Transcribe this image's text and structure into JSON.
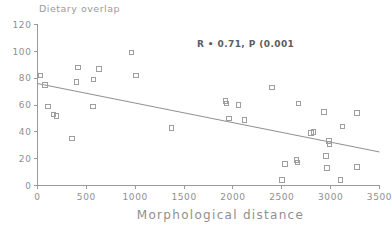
{
  "chart_data": {
    "type": "scatter",
    "title": "",
    "xlabel": "Morphological distance",
    "ylabel": "Dietary overlap",
    "xlim": [
      0,
      3500
    ],
    "ylim": [
      0,
      120
    ],
    "xticks": [
      0,
      500,
      1000,
      1500,
      2000,
      2500,
      3000,
      3500
    ],
    "yticks": [
      0,
      20,
      40,
      60,
      80,
      100,
      120
    ],
    "xtick_labels": [
      "0",
      "500",
      "1000",
      "1500",
      "2000",
      "2500",
      "3000",
      "3500"
    ],
    "ytick_labels": [
      "0",
      "20",
      "40",
      "60",
      "80",
      "100",
      "120"
    ],
    "grid": false,
    "legend": null,
    "annotation": "R • 0.71, P (0.001",
    "annotation_meaning": "R = 0.71, P < 0.001",
    "marker": "open-square",
    "marker_color": "#9e9e9e",
    "points": [
      {
        "x": 30,
        "y": 82
      },
      {
        "x": 75,
        "y": 75
      },
      {
        "x": 110,
        "y": 59
      },
      {
        "x": 165,
        "y": 53
      },
      {
        "x": 195,
        "y": 52
      },
      {
        "x": 350,
        "y": 35
      },
      {
        "x": 400,
        "y": 77
      },
      {
        "x": 415,
        "y": 88
      },
      {
        "x": 565,
        "y": 59
      },
      {
        "x": 575,
        "y": 79
      },
      {
        "x": 630,
        "y": 87
      },
      {
        "x": 960,
        "y": 99
      },
      {
        "x": 1010,
        "y": 82
      },
      {
        "x": 1370,
        "y": 43
      },
      {
        "x": 1925,
        "y": 63
      },
      {
        "x": 1935,
        "y": 61
      },
      {
        "x": 1960,
        "y": 50
      },
      {
        "x": 2055,
        "y": 60
      },
      {
        "x": 2120,
        "y": 49
      },
      {
        "x": 2400,
        "y": 73
      },
      {
        "x": 2500,
        "y": 4
      },
      {
        "x": 2530,
        "y": 16
      },
      {
        "x": 2650,
        "y": 19
      },
      {
        "x": 2660,
        "y": 17
      },
      {
        "x": 2670,
        "y": 61
      },
      {
        "x": 2800,
        "y": 39
      },
      {
        "x": 2825,
        "y": 40
      },
      {
        "x": 2930,
        "y": 55
      },
      {
        "x": 2950,
        "y": 22
      },
      {
        "x": 2960,
        "y": 13
      },
      {
        "x": 2985,
        "y": 33
      },
      {
        "x": 2990,
        "y": 31
      },
      {
        "x": 3100,
        "y": 4
      },
      {
        "x": 3120,
        "y": 44
      },
      {
        "x": 3270,
        "y": 14
      },
      {
        "x": 3270,
        "y": 54
      }
    ],
    "trend_line": {
      "x0": 0,
      "y0": 76,
      "x1": 3500,
      "y1": 25
    }
  },
  "colors": {
    "background": "#ffffff",
    "axis": "#9a9a9a",
    "marker": "#9e9e9e",
    "trend": "#8f8f8f",
    "annotation": "#5d5d5d"
  }
}
